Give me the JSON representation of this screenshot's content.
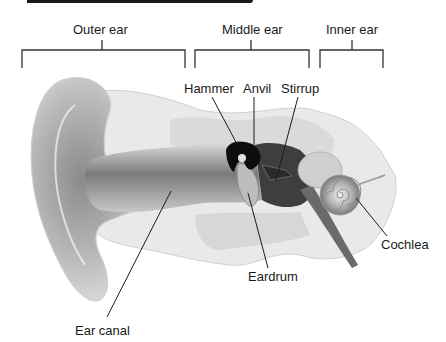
{
  "diagram": {
    "type": "anatomical-illustration",
    "regions": [
      {
        "label": "Outer ear"
      },
      {
        "label": "Middle ear"
      },
      {
        "label": "Inner ear"
      }
    ],
    "parts": [
      {
        "label": "Hammer"
      },
      {
        "label": "Anvil"
      },
      {
        "label": "Stirrup"
      },
      {
        "label": "Cochlea"
      },
      {
        "label": "Eardrum"
      },
      {
        "label": "Ear canal"
      }
    ]
  },
  "colors": {
    "line": "#1a1a1a",
    "tissue_light": "#e6e6e6",
    "tissue_mid": "#bdbdbd",
    "tissue_dark": "#555555",
    "ossicle": "#0d0d0d"
  }
}
